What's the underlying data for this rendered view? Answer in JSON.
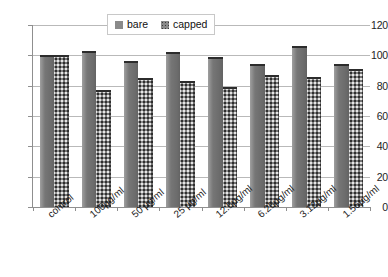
{
  "chart_data": {
    "type": "bar",
    "title": "",
    "subtitle": "",
    "xlabel": "",
    "ylabel": "",
    "categories": [
      "control",
      "100µg/ml",
      "50 µg/ml",
      "25 µg/ml",
      "12.5µg/ml",
      "6.25µg/ml",
      "3.12µg/ml",
      "1.56µg/ml"
    ],
    "series": [
      {
        "name": "bare",
        "values": [
          100,
          103,
          96,
          102,
          99,
          94,
          106,
          94
        ]
      },
      {
        "name": "capped",
        "values": [
          100,
          77,
          85,
          83,
          79,
          87,
          86,
          91
        ]
      }
    ],
    "ylim": [
      0,
      120
    ],
    "ytick_labels": [
      "120",
      "100",
      "80",
      "60",
      "40",
      "20",
      "0"
    ],
    "ytick_values": [
      120,
      100,
      80,
      60,
      40,
      20,
      0
    ],
    "grid": true,
    "legend_position": "top-center",
    "colors": {
      "bare": "#767676",
      "capped": "#7c7c7c",
      "gridline": "#b9b9b9",
      "axis": "#8f8f8f",
      "text": "#1a1a1a",
      "background": "#ffffff"
    }
  },
  "legend": {
    "entries": [
      {
        "label": "bare",
        "swatch": "bare-swatch-icon"
      },
      {
        "label": "capped",
        "swatch": "capped-swatch-icon"
      }
    ]
  }
}
